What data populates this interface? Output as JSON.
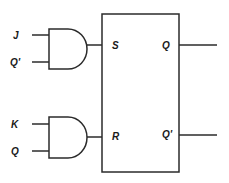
{
  "diagram": {
    "type": "JK flip-flop built from SR flip-flop with AND gates",
    "gates": [
      {
        "id": "and-top",
        "type": "AND",
        "inputs": [
          "J",
          "Q'"
        ],
        "output_to": "S"
      },
      {
        "id": "and-bottom",
        "type": "AND",
        "inputs": [
          "K",
          "Q"
        ],
        "output_to": "R"
      }
    ],
    "block": {
      "type": "SR flip-flop",
      "inputs": {
        "top": "S",
        "bottom": "R"
      },
      "outputs": {
        "top": "Q",
        "bottom": "Q'"
      }
    },
    "labels": {
      "j": "J",
      "q_prime_in": "Q'",
      "k": "K",
      "q_in": "Q",
      "s": "S",
      "r": "R",
      "q_out": "Q",
      "q_prime_out": "Q'"
    },
    "colors": {
      "stroke": "#2b2b2b",
      "text": "#1a1a1a",
      "background": "#ffffff"
    }
  }
}
